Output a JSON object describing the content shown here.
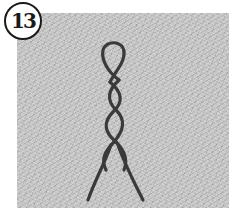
{
  "badge": {
    "number": "13"
  },
  "illustration": {
    "subject": "braided-rope-icon",
    "stroke_color": "#3a3a3a",
    "background_color": "#c6c6c6"
  }
}
